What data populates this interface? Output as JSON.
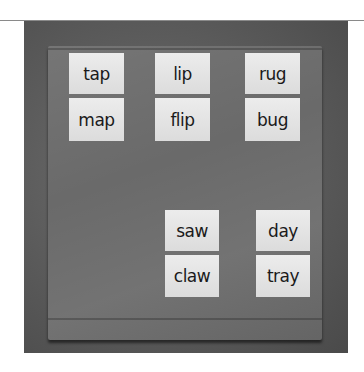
{
  "image": {
    "description": "Pocket chart with word cards grouped in rhyming pairs",
    "cards": [
      {
        "word": "tap"
      },
      {
        "word": "map"
      },
      {
        "word": "lip"
      },
      {
        "word": "flip"
      },
      {
        "word": "rug"
      },
      {
        "word": "bug"
      },
      {
        "word": "saw"
      },
      {
        "word": "claw"
      },
      {
        "word": "day"
      },
      {
        "word": "tray"
      }
    ]
  }
}
